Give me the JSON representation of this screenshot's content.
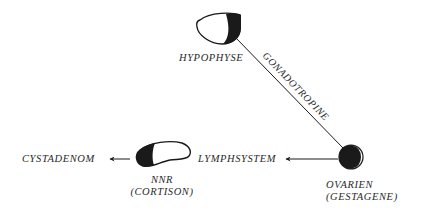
{
  "diagram": {
    "nodes": {
      "hypophyse": {
        "label": "HYPOPHYSE"
      },
      "ovarien": {
        "label": "OVARIEN",
        "sublabel": "(GESTAGENE)"
      },
      "nnr": {
        "label": "NNR",
        "sublabel": "(CORTISON)"
      },
      "lymphsystem": {
        "label": "LYMPHSYSTEM"
      },
      "cystadenom": {
        "label": "CYSTADENOM"
      }
    },
    "edges": {
      "hypophyse_ovarien": {
        "label": "GONADOTROPINE"
      },
      "ovarien_lymphsystem": {
        "label": ""
      },
      "nnr_cystadenom": {
        "label": ""
      }
    },
    "colors": {
      "ink": "#1a1a1a",
      "text": "#2a2a2a",
      "background": "#ffffff"
    }
  }
}
